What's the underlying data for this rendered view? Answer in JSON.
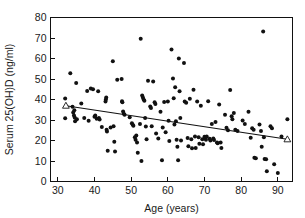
{
  "chart_data": {
    "type": "scatter",
    "title": "",
    "xlabel": "Age (years)",
    "ylabel": "Serum 25(OH)D (ng/ml)",
    "xlim": [
      28,
      94
    ],
    "ylim": [
      0,
      80
    ],
    "xticks": [
      30,
      40,
      50,
      60,
      70,
      80,
      90
    ],
    "yticks": [
      0,
      10,
      20,
      30,
      40,
      50,
      60,
      70,
      80
    ],
    "grid": false,
    "legend": null,
    "series": [
      {
        "name": "Serum 25(OH)D by age",
        "marker": "filled-circle",
        "color": "#111111",
        "points": [
          [
            32.0,
            40.5
          ],
          [
            32.0,
            30.8
          ],
          [
            33.4,
            52.8
          ],
          [
            34.0,
            36.5
          ],
          [
            34.2,
            33.6
          ],
          [
            34.4,
            32.2
          ],
          [
            34.5,
            34.8
          ],
          [
            34.6,
            31.2
          ],
          [
            34.7,
            29.4
          ],
          [
            35.0,
            48.0
          ],
          [
            35.2,
            30.4
          ],
          [
            36.4,
            38.0
          ],
          [
            37.2,
            31.0
          ],
          [
            38.0,
            44.2
          ],
          [
            38.4,
            29.6
          ],
          [
            39.0,
            45.4
          ],
          [
            39.6,
            45.0
          ],
          [
            40.0,
            31.6
          ],
          [
            40.2,
            32.2
          ],
          [
            40.6,
            30.6
          ],
          [
            41.0,
            44.0
          ],
          [
            41.2,
            31.0
          ],
          [
            41.4,
            30.2
          ],
          [
            42.0,
            26.6
          ],
          [
            43.0,
            39.0
          ],
          [
            43.1,
            40.0
          ],
          [
            43.2,
            41.0
          ],
          [
            43.3,
            25.2
          ],
          [
            43.4,
            24.4
          ],
          [
            43.6,
            15.0
          ],
          [
            44.4,
            26.4
          ],
          [
            45.0,
            58.6
          ],
          [
            45.2,
            27.0
          ],
          [
            45.4,
            19.4
          ],
          [
            45.6,
            14.6
          ],
          [
            46.2,
            49.6
          ],
          [
            47.4,
            50.0
          ],
          [
            47.5,
            39.2
          ],
          [
            47.6,
            38.6
          ],
          [
            47.8,
            34.2
          ],
          [
            48.0,
            33.0
          ],
          [
            48.2,
            32.6
          ],
          [
            49.6,
            31.4
          ],
          [
            50.2,
            28.4
          ],
          [
            50.4,
            27.8
          ],
          [
            50.6,
            27.2
          ],
          [
            51.0,
            21.6
          ],
          [
            51.2,
            20.4
          ],
          [
            51.4,
            22.4
          ],
          [
            51.6,
            19.0
          ],
          [
            51.8,
            14.0
          ],
          [
            52.4,
            28.0
          ],
          [
            52.6,
            69.6
          ],
          [
            52.8,
            10.0
          ],
          [
            53.0,
            42.0
          ],
          [
            53.2,
            41.0
          ],
          [
            53.4,
            40.0
          ],
          [
            53.6,
            39.4
          ],
          [
            53.8,
            31.0
          ],
          [
            54.0,
            26.8
          ],
          [
            54.2,
            20.6
          ],
          [
            54.6,
            49.2
          ],
          [
            55.2,
            36.6
          ],
          [
            55.4,
            35.8
          ],
          [
            55.6,
            27.0
          ],
          [
            56.0,
            48.8
          ],
          [
            56.4,
            38.6
          ],
          [
            56.6,
            37.8
          ],
          [
            56.8,
            23.4
          ],
          [
            57.4,
            21.0
          ],
          [
            58.0,
            34.0
          ],
          [
            58.4,
            10.4
          ],
          [
            58.6,
            26.4
          ],
          [
            59.0,
            38.8
          ],
          [
            59.4,
            24.0
          ],
          [
            60.0,
            39.0
          ],
          [
            60.2,
            29.6
          ],
          [
            60.4,
            19.8
          ],
          [
            61.0,
            64.4
          ],
          [
            61.4,
            50.2
          ],
          [
            61.6,
            40.6
          ],
          [
            61.8,
            27.8
          ],
          [
            62.0,
            46.0
          ],
          [
            62.2,
            29.4
          ],
          [
            62.4,
            20.4
          ],
          [
            62.6,
            17.0
          ],
          [
            62.8,
            10.4
          ],
          [
            63.0,
            60.0
          ],
          [
            63.2,
            44.0
          ],
          [
            63.4,
            31.0
          ],
          [
            63.6,
            20.0
          ],
          [
            64.4,
            57.8
          ],
          [
            64.6,
            39.0
          ],
          [
            65.0,
            38.4
          ],
          [
            65.4,
            21.2
          ],
          [
            65.6,
            17.2
          ],
          [
            66.0,
            40.4
          ],
          [
            66.4,
            20.6
          ],
          [
            66.6,
            16.2
          ],
          [
            67.0,
            44.8
          ],
          [
            67.4,
            22.0
          ],
          [
            67.6,
            16.4
          ],
          [
            68.0,
            39.0
          ],
          [
            68.4,
            21.6
          ],
          [
            68.6,
            18.4
          ],
          [
            69.0,
            37.0
          ],
          [
            69.4,
            20.6
          ],
          [
            69.6,
            18.2
          ],
          [
            70.0,
            21.8
          ],
          [
            70.2,
            21.0
          ],
          [
            70.4,
            20.4
          ],
          [
            70.6,
            22.0
          ],
          [
            71.0,
            39.2
          ],
          [
            71.4,
            20.8
          ],
          [
            71.6,
            20.0
          ],
          [
            72.0,
            28.0
          ],
          [
            72.4,
            21.0
          ],
          [
            72.6,
            20.2
          ],
          [
            73.0,
            29.0
          ],
          [
            73.4,
            19.0
          ],
          [
            73.6,
            18.6
          ],
          [
            74.0,
            37.6
          ],
          [
            74.4,
            19.0
          ],
          [
            74.6,
            16.4
          ],
          [
            75.6,
            32.6
          ],
          [
            76.0,
            26.2
          ],
          [
            76.4,
            25.0
          ],
          [
            77.0,
            44.6
          ],
          [
            77.4,
            31.8
          ],
          [
            77.6,
            30.4
          ],
          [
            78.0,
            33.4
          ],
          [
            78.4,
            25.2
          ],
          [
            79.0,
            24.6
          ],
          [
            80.4,
            29.8
          ],
          [
            81.0,
            28.0
          ],
          [
            82.0,
            34.0
          ],
          [
            82.6,
            21.4
          ],
          [
            83.0,
            26.0
          ],
          [
            83.4,
            25.2
          ],
          [
            83.6,
            11.6
          ],
          [
            84.0,
            11.4
          ],
          [
            85.0,
            27.8
          ],
          [
            85.4,
            24.6
          ],
          [
            85.6,
            17.0
          ],
          [
            86.0,
            73.2
          ],
          [
            86.2,
            21.6
          ],
          [
            86.4,
            11.0
          ],
          [
            86.8,
            10.8
          ],
          [
            87.0,
            5.0
          ],
          [
            88.0,
            27.0
          ],
          [
            88.4,
            26.0
          ],
          [
            89.0,
            8.4
          ],
          [
            90.0,
            4.2
          ],
          [
            91.0,
            22.0
          ],
          [
            92.6,
            30.4
          ]
        ]
      },
      {
        "name": "Regression endpoints",
        "marker": "open-triangle",
        "color": "#111111",
        "points": [
          [
            32.2,
            37.0
          ],
          [
            92.6,
            20.6
          ]
        ]
      }
    ],
    "trendline": {
      "type": "linear-fit",
      "x_start": 32.2,
      "y_start": 37.0,
      "x_end": 92.6,
      "y_end": 20.6
    }
  },
  "axes": {
    "x_title": "Age (years)",
    "y_title": "Serum 25(OH)D (ng/ml)",
    "x_tick_labels": [
      "30",
      "40",
      "50",
      "60",
      "70",
      "80",
      "90"
    ],
    "y_tick_labels": [
      "0",
      "10",
      "20",
      "30",
      "40",
      "50",
      "60",
      "70",
      "80"
    ]
  },
  "colors": {
    "marker": "#111111",
    "axis": "#111111",
    "background": "#ffffff"
  }
}
